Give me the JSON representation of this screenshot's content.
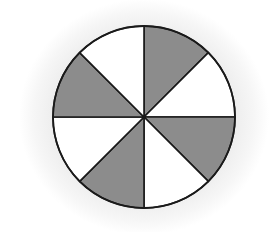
{
  "diagram": {
    "title": "",
    "center": [
      144,
      117
    ],
    "radius": 91,
    "total_sectors": 8,
    "shaded_sectors": 4,
    "colors": {
      "shaded": "#8c8c8c",
      "unshaded": "#ffffff",
      "stroke": "#1a1a1a",
      "background_halo": "#e8e8e8"
    },
    "sectors": [
      {
        "index": 0,
        "start_deg": 0,
        "end_deg": 45,
        "shaded": true
      },
      {
        "index": 1,
        "start_deg": 45,
        "end_deg": 90,
        "shaded": false
      },
      {
        "index": 2,
        "start_deg": 90,
        "end_deg": 135,
        "shaded": true
      },
      {
        "index": 3,
        "start_deg": 135,
        "end_deg": 180,
        "shaded": false
      },
      {
        "index": 4,
        "start_deg": 180,
        "end_deg": 225,
        "shaded": true
      },
      {
        "index": 5,
        "start_deg": 225,
        "end_deg": 270,
        "shaded": false
      },
      {
        "index": 6,
        "start_deg": 270,
        "end_deg": 315,
        "shaded": true
      },
      {
        "index": 7,
        "start_deg": 315,
        "end_deg": 360,
        "shaded": false
      }
    ]
  }
}
